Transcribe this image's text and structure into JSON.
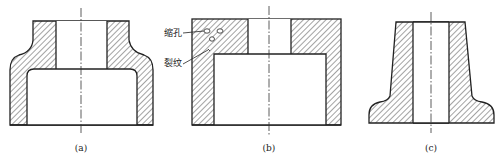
{
  "figure": {
    "panels": [
      {
        "id": "a",
        "caption": "(a)",
        "description": "casting cross-section with thick top flange and shoulder"
      },
      {
        "id": "b",
        "caption": "(b)",
        "description": "casting cross-section with defects at thick junction"
      },
      {
        "id": "c",
        "caption": "(c)",
        "description": "tapered casting cross-section with flared base"
      }
    ],
    "annotations": {
      "shrinkage_hole": "缩孔",
      "crack": "裂纹"
    }
  }
}
